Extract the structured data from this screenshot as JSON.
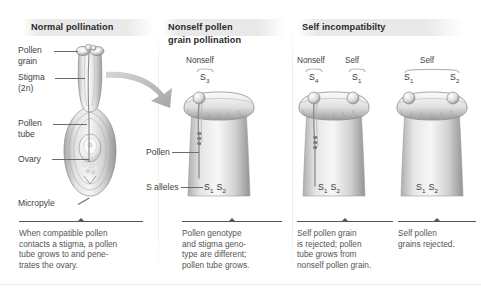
{
  "figure": {
    "panels": [
      {
        "id": "normal-pollination",
        "title": "Normal pollination",
        "labels": [
          {
            "name": "pollen-grain",
            "text": "Pollen\ngrain"
          },
          {
            "name": "stigma",
            "text": "Stigma\n(2n)"
          },
          {
            "name": "pollen-tube",
            "text": "Pollen\ntube"
          },
          {
            "name": "ovary",
            "text": "Ovary"
          },
          {
            "name": "micropyle",
            "text": "Micropyle"
          }
        ],
        "caption": "When compatible pollen\ncontacts a stigma, a pollen\ntube grows to and pene-\ntrates the ovary."
      },
      {
        "id": "nonself-pollen-grain-pollination",
        "title": "Nonself pollen\ngrain pollination",
        "top_labels": [
          {
            "name": "nonself-label",
            "text": "Nonself"
          }
        ],
        "grain_alleles": [
          {
            "name": "pollen-grain-allele-s3",
            "symbol": "S",
            "sub": "3"
          }
        ],
        "labels": [
          {
            "name": "pollen",
            "text": "Pollen"
          },
          {
            "name": "s-alleles",
            "text": "S alleles"
          }
        ],
        "stigma_genotype": {
          "a": {
            "symbol": "S",
            "sub": "1"
          },
          "b": {
            "symbol": "S",
            "sub": "2"
          }
        },
        "caption": "Pollen genotype\nand stigma geno-\ntype are different;\npollen tube grows."
      },
      {
        "id": "self-incompatibility-partial",
        "title": "Self incompatibilty",
        "top_labels": [
          {
            "name": "nonself-label",
            "text": "Nonself"
          },
          {
            "name": "self-label",
            "text": "Self"
          }
        ],
        "grain_alleles": [
          {
            "name": "pollen-grain-allele-s4",
            "symbol": "S",
            "sub": "4"
          },
          {
            "name": "pollen-grain-allele-s1",
            "symbol": "S",
            "sub": "1"
          }
        ],
        "stigma_genotype": {
          "a": {
            "symbol": "S",
            "sub": "1"
          },
          "b": {
            "symbol": "S",
            "sub": "2"
          }
        },
        "caption": "Self pollen grain\nis rejected; pollen\ntube grows from\nnonself pollen grain."
      },
      {
        "id": "self-incompatibility-full",
        "top_labels": [
          {
            "name": "self-label",
            "text": "Self"
          }
        ],
        "grain_alleles": [
          {
            "name": "pollen-grain-allele-s1",
            "symbol": "S",
            "sub": "1"
          },
          {
            "name": "pollen-grain-allele-s2",
            "symbol": "S",
            "sub": "2"
          }
        ],
        "stigma_genotype": {
          "a": {
            "symbol": "S",
            "sub": "1"
          },
          "b": {
            "symbol": "S",
            "sub": "2"
          }
        },
        "caption": "Self pollen\ngrains rejected."
      }
    ],
    "colors": {
      "banner": "#e9e9e9",
      "text": "#3f3f3f",
      "title": "#2b2b2b",
      "caption": "#555555",
      "leader": "#6a6a6a",
      "tissue_light": "#f3f3f3",
      "tissue_mid": "#c9c9c9",
      "tissue_dark": "#8f8f8f",
      "arrow": "#b6b6b6"
    }
  }
}
